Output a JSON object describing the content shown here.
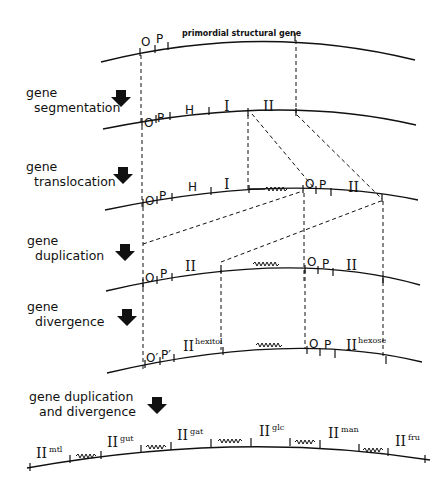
{
  "figure": {
    "primordial_label": "primordial structural gene"
  },
  "steps": [
    {
      "id": "segmentation",
      "line1": "gene",
      "line2": "segmentation"
    },
    {
      "id": "translocation",
      "line1": "gene",
      "line2": "translocation"
    },
    {
      "id": "duplication",
      "line1": "gene",
      "line2": "duplication"
    },
    {
      "id": "divergence",
      "line1": "gene",
      "line2": "divergence"
    },
    {
      "id": "dup_div",
      "line1": "gene duplication",
      "line2": "and divergence"
    }
  ],
  "rows": {
    "r1": {
      "o": "O",
      "p": "P"
    },
    "r2": {
      "o": "O",
      "p": "P",
      "h": "H",
      "i": "I",
      "ii": "II"
    },
    "r3": {
      "o": "O",
      "p": "P",
      "h": "H",
      "i": "I",
      "o2": "O",
      "p2": "P",
      "ii": "II"
    },
    "r4": {
      "o": "O",
      "p": "P",
      "ii": "II",
      "o2": "O",
      "p2": "P",
      "ii2": "II"
    },
    "r5": {
      "o": "O′",
      "p": "P′",
      "ii": "II",
      "ii_sup": "hexitol",
      "o2": "O",
      "p2": "P",
      "ii2": "II",
      "ii2_sup": "hexose"
    },
    "r6": {
      "genes": [
        {
          "label": "II",
          "sup": "mtl"
        },
        {
          "label": "II",
          "sup": "gut"
        },
        {
          "label": "II",
          "sup": "gat"
        },
        {
          "label": "II",
          "sup": "glc"
        },
        {
          "label": "II",
          "sup": "man"
        },
        {
          "label": "II",
          "sup": "fru"
        }
      ]
    }
  }
}
